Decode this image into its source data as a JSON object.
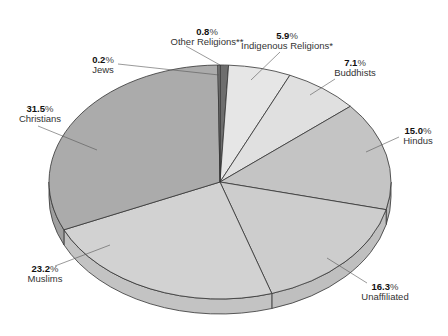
{
  "chart_data": {
    "type": "pie",
    "title": "",
    "style": "3d-pie-grayscale",
    "start_angle_deg": 0,
    "direction": "clockwise",
    "categories": [
      "Other Religions**",
      "Indigenous Religions*",
      "Buddhists",
      "Hindus",
      "Unaffiliated",
      "Muslims",
      "Christians",
      "Jews"
    ],
    "values": [
      0.8,
      5.9,
      7.1,
      15.0,
      16.3,
      23.2,
      31.5,
      0.2
    ],
    "unit": "%",
    "slices": [
      {
        "name": "Other Religions**",
        "value": 0.8,
        "pct_label": "0.8",
        "color": "#6e6e6e"
      },
      {
        "name": "Indigenous Religions*",
        "value": 5.9,
        "pct_label": "5.9",
        "color": "#e6e6e6"
      },
      {
        "name": "Buddhists",
        "value": 7.1,
        "pct_label": "7.1",
        "color": "#e0e0e0"
      },
      {
        "name": "Hindus",
        "value": 15.0,
        "pct_label": "15.0",
        "color": "#c4c4c4"
      },
      {
        "name": "Unaffiliated",
        "value": 16.3,
        "pct_label": "16.3",
        "color": "#cdcdcd"
      },
      {
        "name": "Muslims",
        "value": 23.2,
        "pct_label": "23.2",
        "color": "#d2d2d2"
      },
      {
        "name": "Christians",
        "value": 31.5,
        "pct_label": "31.5",
        "color": "#ababab"
      },
      {
        "name": "Jews",
        "value": 0.2,
        "pct_label": "0.2",
        "color": "#8a8a8a"
      }
    ]
  },
  "labels": {
    "other": {
      "value": "0.8",
      "unit": "%",
      "name": "Other Religions**"
    },
    "indigenous": {
      "value": "5.9",
      "unit": "%",
      "name": "Indigenous Religions*"
    },
    "buddhists": {
      "value": "7.1",
      "unit": "%",
      "name": "Buddhists"
    },
    "hindus": {
      "value": "15.0",
      "unit": "%",
      "name": "Hindus"
    },
    "unaffiliated": {
      "value": "16.3",
      "unit": "%",
      "name": "Unaffiliated"
    },
    "muslims": {
      "value": "23.2",
      "unit": "%",
      "name": "Muslims"
    },
    "christians": {
      "value": "31.5",
      "unit": "%",
      "name": "Christians"
    },
    "jews": {
      "value": "0.2",
      "unit": "%",
      "name": "Jews"
    }
  }
}
